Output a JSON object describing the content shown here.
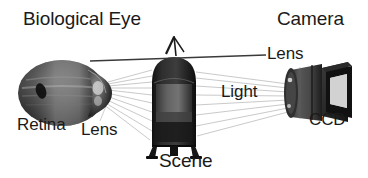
{
  "figure": {
    "background_color": "#ffffff",
    "text_color": "#1a1a1a",
    "ray_color": "#b4b4b4",
    "leader_color": "#333333"
  },
  "labels": {
    "biological_eye": "Biological Eye",
    "camera": "Camera",
    "retina": "Retina",
    "lens_eye": "Lens",
    "scene": "Scene",
    "light": "Light",
    "lens_camera": "Lens",
    "ccd": "CCD"
  },
  "objects": {
    "eye": {
      "name": "eyeball",
      "description": "dark grey photographic eyeball with bulging cornea on its right side",
      "fill": "#3a3a3a"
    },
    "scene": {
      "name": "lamp-object",
      "description": "dark bell-shaped lantern object with small legs, standing in the centre",
      "fill": "#2b2b2b"
    },
    "camera": {
      "name": "camera-body",
      "description": "dark cylindrical camera lens barrel with a rectangular CCD housing behind it",
      "fill": "#3c3c3c"
    }
  }
}
